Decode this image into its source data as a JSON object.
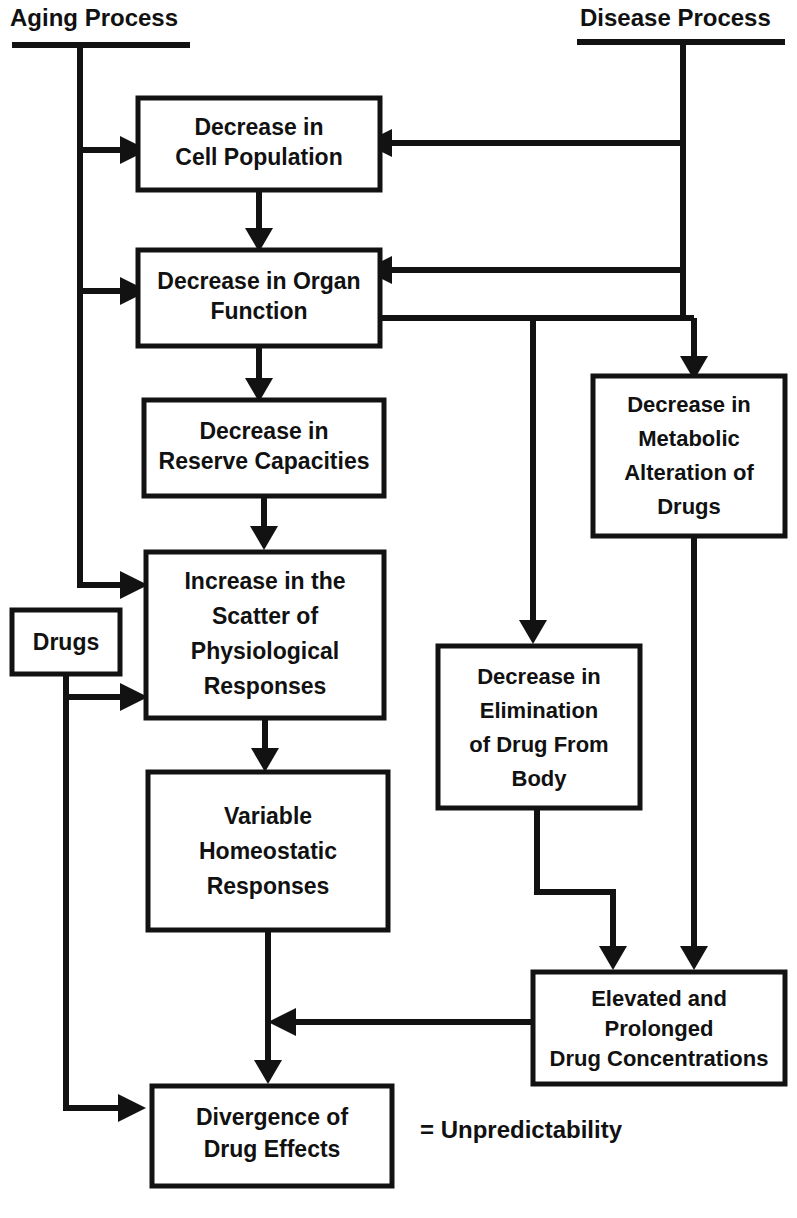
{
  "diagram": {
    "colors": {
      "line": "#121212",
      "box_fill": "#ffffff",
      "text": "#111111",
      "background": "#ffffff"
    },
    "sources": [
      {
        "id": "aging",
        "label": "Aging Process"
      },
      {
        "id": "disease",
        "label": "Disease Process"
      }
    ],
    "nodes": [
      {
        "id": "cell-population",
        "lines": [
          "Decrease in",
          "Cell Population"
        ]
      },
      {
        "id": "organ-function",
        "lines": [
          "Decrease in Organ",
          "Function"
        ]
      },
      {
        "id": "reserve-capacities",
        "lines": [
          "Decrease in",
          "Reserve Capacities"
        ]
      },
      {
        "id": "scatter-physiological",
        "lines": [
          "Increase in the",
          "Scatter of",
          "Physiological",
          "Responses"
        ]
      },
      {
        "id": "drugs",
        "lines": [
          "Drugs"
        ]
      },
      {
        "id": "homeostatic-responses",
        "lines": [
          "Variable",
          "Homeostatic",
          "Responses"
        ]
      },
      {
        "id": "metabolic-alteration",
        "lines": [
          "Decrease in",
          "Metabolic",
          "Alteration of",
          "Drugs"
        ]
      },
      {
        "id": "elimination-of-drug",
        "lines": [
          "Decrease in",
          "Elimination",
          "of Drug From",
          "Body"
        ]
      },
      {
        "id": "drug-concentrations",
        "lines": [
          "Elevated and",
          "Prolonged",
          "Drug Concentrations"
        ]
      },
      {
        "id": "divergence-drug-effects",
        "lines": [
          "Divergence of",
          "Drug Effects"
        ]
      }
    ],
    "legend": {
      "equals_text": "= Unpredictability"
    },
    "edges": [
      {
        "from": "aging",
        "to": "cell-population"
      },
      {
        "from": "aging",
        "to": "organ-function"
      },
      {
        "from": "aging",
        "to": "scatter-physiological"
      },
      {
        "from": "disease",
        "to": "cell-population"
      },
      {
        "from": "disease",
        "to": "organ-function"
      },
      {
        "from": "disease",
        "to": "metabolic-alteration"
      },
      {
        "from": "cell-population",
        "to": "organ-function"
      },
      {
        "from": "organ-function",
        "to": "reserve-capacities"
      },
      {
        "from": "organ-function",
        "to": "elimination-of-drug"
      },
      {
        "from": "organ-function",
        "to": "metabolic-alteration"
      },
      {
        "from": "reserve-capacities",
        "to": "scatter-physiological"
      },
      {
        "from": "drugs",
        "to": "scatter-physiological"
      },
      {
        "from": "drugs",
        "to": "divergence-drug-effects"
      },
      {
        "from": "scatter-physiological",
        "to": "homeostatic-responses"
      },
      {
        "from": "homeostatic-responses",
        "to": "divergence-drug-effects"
      },
      {
        "from": "metabolic-alteration",
        "to": "drug-concentrations"
      },
      {
        "from": "elimination-of-drug",
        "to": "drug-concentrations"
      },
      {
        "from": "drug-concentrations",
        "to": "divergence-drug-effects"
      }
    ]
  }
}
